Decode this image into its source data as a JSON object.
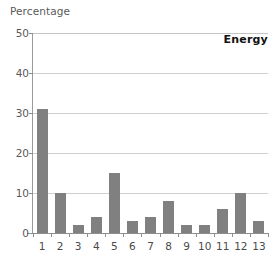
{
  "chart_data": {
    "type": "bar",
    "title": "Energy",
    "xlabel": "",
    "ylabel": "Percentage",
    "categories": [
      "1",
      "2",
      "3",
      "4",
      "5",
      "6",
      "7",
      "8",
      "9",
      "10",
      "11",
      "12",
      "13"
    ],
    "values": [
      31,
      10,
      2,
      4,
      15,
      3,
      4,
      8,
      2,
      2,
      6,
      10,
      3
    ],
    "ylim": [
      0,
      50
    ],
    "yticks": [
      "0",
      "10",
      "20",
      "30",
      "40",
      "50"
    ],
    "ytick_values": [
      0,
      10,
      20,
      30,
      40,
      50
    ],
    "grid": "horizontal",
    "legend": "none",
    "series": [
      {
        "name": "Energy",
        "values": [
          31,
          10,
          2,
          4,
          15,
          3,
          4,
          8,
          2,
          2,
          6,
          10,
          3
        ]
      }
    ]
  },
  "style": {
    "bar_color": "#808080",
    "gridline_color": "#cfcfcf",
    "axis_color": "#8e8e8e",
    "tick_text_color": "#4a4a4a",
    "axis_label_color": "#5a5a5a",
    "title_color": "#111111",
    "background": "#ffffff"
  }
}
